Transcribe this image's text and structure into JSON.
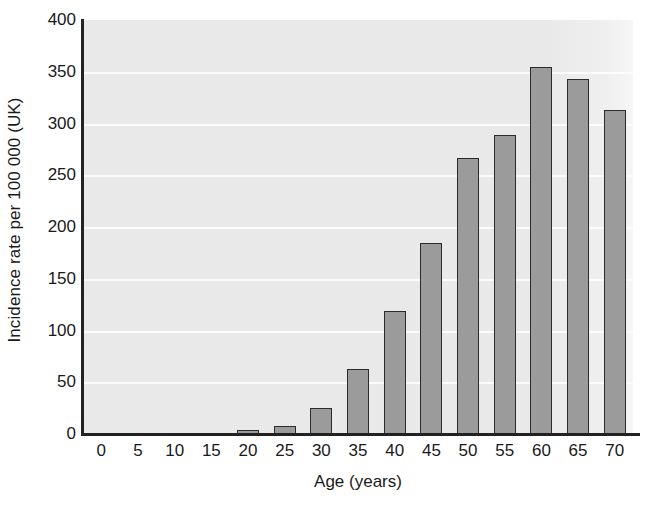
{
  "chart_data": {
    "type": "bar",
    "title": "",
    "xlabel": "Age (years)",
    "ylabel": "Incidence rate per 100 000 (UK)",
    "categories": [
      "0",
      "5",
      "10",
      "15",
      "20",
      "25",
      "30",
      "35",
      "40",
      "45",
      "50",
      "55",
      "60",
      "65",
      "70"
    ],
    "values": [
      0,
      0,
      0,
      0,
      4,
      8,
      25,
      63,
      119,
      185,
      267,
      289,
      355,
      343,
      313
    ],
    "ylim": [
      0,
      400
    ],
    "yticks": [
      "0",
      "50",
      "100",
      "150",
      "200",
      "250",
      "300",
      "350",
      "400"
    ],
    "ytick_values": [
      0,
      50,
      100,
      150,
      200,
      250,
      300,
      350,
      400
    ],
    "grid": "horizontal",
    "legend": "none",
    "bar_color": "#9b9b9b",
    "bar_edge_color": "#2b2b2b",
    "plot_background": "#e9e9e9",
    "gridline_color": "#fcfcfc",
    "axis_color": "#222222"
  }
}
